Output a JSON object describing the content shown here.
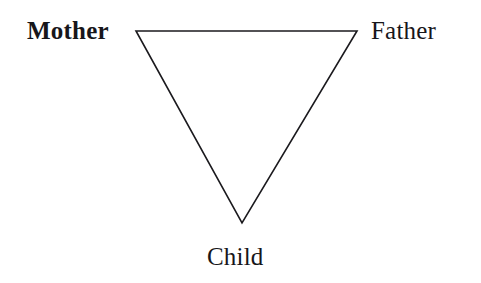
{
  "figure": {
    "type": "triangle-diagram",
    "background_color": "#ffffff",
    "line_color": "#1b1a1e",
    "text_color": "#17161a",
    "shape": {
      "name": "inverted-triangle",
      "vertices": [
        {
          "id": "top-left",
          "x": 136,
          "y": 31
        },
        {
          "id": "top-right",
          "x": 357,
          "y": 31
        },
        {
          "id": "bottom",
          "x": 242,
          "y": 223
        }
      ],
      "stroke_width": 1.6,
      "filled": false
    },
    "labels": [
      {
        "id": "mother",
        "text": "Mother",
        "position": "top-left",
        "weight": "bold"
      },
      {
        "id": "father",
        "text": "Father",
        "position": "top-right",
        "weight": "regular"
      },
      {
        "id": "child",
        "text": "Child",
        "position": "bottom",
        "weight": "regular"
      }
    ]
  },
  "nodes": {
    "mother": "Mother",
    "father": "Father",
    "child": "Child"
  }
}
